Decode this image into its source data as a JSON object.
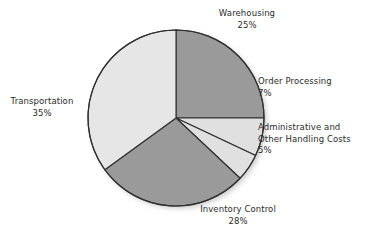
{
  "chart_data": {
    "type": "pie",
    "title": "",
    "legend_position": "none",
    "labels_outside": true,
    "unit": "%",
    "total": 100,
    "categories": [
      "Warehousing",
      "Order Processing",
      "Administrative and Other Handling Costs",
      "Inventory Control",
      "Transportation"
    ],
    "values": [
      25,
      7,
      5,
      28,
      35
    ],
    "slices": [
      {
        "name": "Warehousing",
        "label_lines": [
          "Warehousing"
        ],
        "value": 25,
        "value_label": "25%",
        "color": "#9a9a9a",
        "start_angle_deg": 0,
        "end_angle_deg": 90
      },
      {
        "name": "Order Processing",
        "label_lines": [
          "Order Processing"
        ],
        "value": 7,
        "value_label": "7%",
        "color": "#e0e0e0",
        "start_angle_deg": 90,
        "end_angle_deg": 115.2
      },
      {
        "name": "Administrative and Other Handling Costs",
        "label_lines": [
          "Administrative and",
          "Other Handling Costs"
        ],
        "value": 5,
        "value_label": "5%",
        "color": "#e0e0e0",
        "start_angle_deg": 115.2,
        "end_angle_deg": 133.2
      },
      {
        "name": "Inventory Control",
        "label_lines": [
          "Inventory Control"
        ],
        "value": 28,
        "value_label": "28%",
        "color": "#9a9a9a",
        "start_angle_deg": 133.2,
        "end_angle_deg": 234
      },
      {
        "name": "Transportation",
        "label_lines": [
          "Transportation"
        ],
        "value": 35,
        "value_label": "35%",
        "color": "#e6e6e6",
        "start_angle_deg": 234,
        "end_angle_deg": 360
      }
    ]
  },
  "labels": {
    "warehousing": {
      "name": "Warehousing",
      "pct": "25%"
    },
    "order_processing": {
      "name": "Order Processing",
      "pct": "7%"
    },
    "administrative": {
      "line1": "Administrative and",
      "line2": "Other Handling Costs",
      "pct": "5%"
    },
    "inventory_control": {
      "name": "Inventory Control",
      "pct": "28%"
    },
    "transportation": {
      "name": "Transportation",
      "pct": "35%"
    }
  },
  "style": {
    "background": "#ffffff",
    "outline": "#2f2f2f",
    "text": "#2b2b2b",
    "shadow": "#c9c9c9"
  },
  "geometry": {
    "center_x": 176,
    "center_y": 118,
    "radius": 88
  }
}
